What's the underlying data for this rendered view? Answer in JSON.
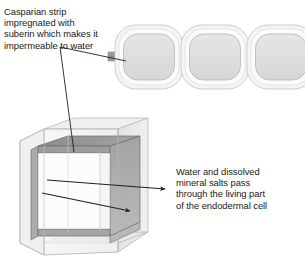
{
  "diagram": {
    "title_absent": true,
    "annotations": {
      "casparian_strip": {
        "text": "Casparian strip\nimpregnated with\nsuberin which makes it\nimpermeable to water",
        "lines": [
          "Casparian strip",
          "impregnated with",
          "suberin which makes it",
          "impermeable to water"
        ]
      },
      "water_pathway": {
        "text": "Water and dissolved\nmineral salts pass\nthrough the living part\nof the endodermal cell",
        "lines": [
          "Water and dissolved",
          "mineral salts pass",
          "through the living part",
          "of the endodermal cell"
        ]
      }
    },
    "colors": {
      "text": "#1a1a1a",
      "leader_line": "#231f20",
      "arrow": "#231f20",
      "cell_wall_outer": "#f2f2f2",
      "cell_wall_stroke": "#c9c9c9",
      "cell_interior": "#e0e0e0",
      "cell_interior_stroke": "#b4b4b4",
      "casparian_block": "#9a9a9a",
      "casparian_block_stroke": "#7d7d7d",
      "box_face_light": "#f4f4f4",
      "box_face_mid": "#e8e8e8",
      "box_face_dark": "#dcdcdc",
      "box_stroke": "#b0b0b0",
      "strip_band_dark": "#8f8f8f",
      "strip_band_mid": "#a8a8a8",
      "strip_band_light": "#bdbdbd",
      "background": "#ffffff"
    },
    "cell_row": {
      "count": 3,
      "cells": [
        {
          "name": "endodermal-cell-1",
          "cx": 150,
          "cy": 56
        },
        {
          "name": "endodermal-cell-2",
          "cx": 215,
          "cy": 56
        },
        {
          "name": "endodermal-cell-3",
          "cx": 280,
          "cy": 56
        }
      ],
      "connector_blocks": [
        {
          "name": "casparian-strip-block-left",
          "x": 113
        },
        {
          "name": "casparian-strip-block-1-2",
          "x": 180
        },
        {
          "name": "casparian-strip-block-2-3",
          "x": 245
        },
        {
          "name": "casparian-strip-block-right",
          "x": 297
        }
      ]
    },
    "cell_3d": {
      "name": "endodermal-cell-3d-block",
      "description": "open rectangular box with inner dark Casparian band"
    },
    "leader_lines": [
      {
        "name": "leader-to-strip-block",
        "from": [
          60,
          47
        ],
        "to": [
          126,
          61
        ]
      },
      {
        "name": "leader-to-3d-band",
        "from": [
          60,
          47
        ],
        "to": [
          74,
          152
        ]
      }
    ],
    "flow_arrows": [
      {
        "name": "water-flow-arrow-upper",
        "from": [
          47,
          179
        ],
        "to": [
          167,
          189
        ]
      },
      {
        "name": "water-flow-arrow-lower",
        "from": [
          42,
          192
        ],
        "to": [
          132,
          211
        ]
      }
    ]
  }
}
